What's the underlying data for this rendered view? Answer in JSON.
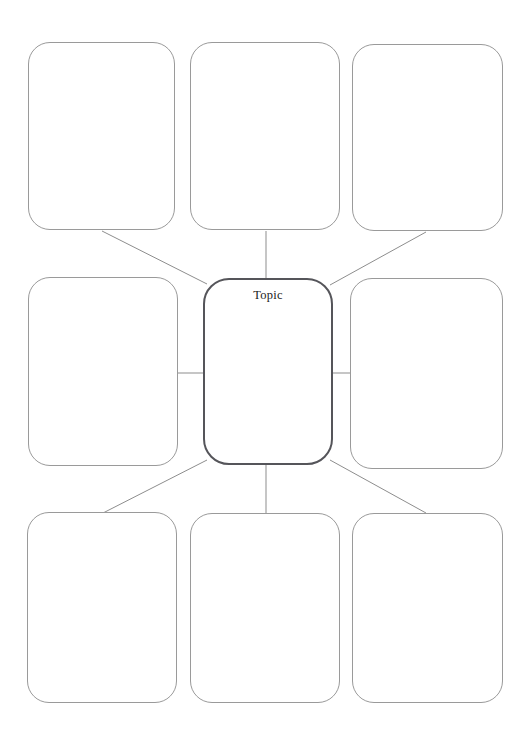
{
  "document": {
    "type": "graphic-organizer",
    "title": "Topic web graphic organizer",
    "page_background": "#ffffff"
  },
  "colors": {
    "page_background": "#ffffff",
    "outer_node_border": "#9a9a9a",
    "center_node_border": "#55555a",
    "connector_line": "#8d8d8d",
    "label_text": "#1d1d1d"
  },
  "center_node": {
    "label": "Topic",
    "x": 203,
    "y": 278,
    "width": 130,
    "height": 187
  },
  "nodes": [
    {
      "id": "node-top-left",
      "label": "",
      "x": 28,
      "y": 42,
      "width": 147,
      "height": 188
    },
    {
      "id": "node-top-center",
      "label": "",
      "x": 190,
      "y": 42,
      "width": 150,
      "height": 188
    },
    {
      "id": "node-top-right",
      "label": "",
      "x": 352,
      "y": 44,
      "width": 151,
      "height": 187
    },
    {
      "id": "node-middle-left",
      "label": "",
      "x": 28,
      "y": 277,
      "width": 150,
      "height": 189
    },
    {
      "id": "node-middle-right",
      "label": "",
      "x": 350,
      "y": 278,
      "width": 153,
      "height": 191
    },
    {
      "id": "node-bottom-left",
      "label": "",
      "x": 27,
      "y": 512,
      "width": 150,
      "height": 191
    },
    {
      "id": "node-bottom-center",
      "label": "",
      "x": 190,
      "y": 513,
      "width": 150,
      "height": 190
    },
    {
      "id": "node-bottom-right",
      "label": "",
      "x": 352,
      "y": 513,
      "width": 151,
      "height": 190
    }
  ],
  "connectors": [
    {
      "id": "connector-top-left",
      "from": "node-top-left",
      "to": "center_node",
      "x1": 102,
      "y1": 231,
      "x2": 207,
      "y2": 284
    },
    {
      "id": "connector-top-center",
      "from": "node-top-center",
      "to": "center_node",
      "x1": 266,
      "y1": 231,
      "x2": 266,
      "y2": 278
    },
    {
      "id": "connector-top-right",
      "from": "node-top-right",
      "to": "center_node",
      "x1": 426,
      "y1": 232,
      "x2": 330,
      "y2": 285
    },
    {
      "id": "connector-middle-left",
      "from": "node-middle-left",
      "to": "center_node",
      "x1": 178,
      "y1": 373,
      "x2": 203,
      "y2": 373
    },
    {
      "id": "connector-middle-right",
      "from": "node-middle-right",
      "to": "center_node",
      "x1": 333,
      "y1": 373,
      "x2": 350,
      "y2": 373
    },
    {
      "id": "connector-bottom-left",
      "from": "center_node",
      "to": "node-bottom-left",
      "x1": 207,
      "y1": 460,
      "x2": 103,
      "y2": 513
    },
    {
      "id": "connector-bottom-center",
      "from": "center_node",
      "to": "node-bottom-center",
      "x1": 266,
      "y1": 465,
      "x2": 266,
      "y2": 513
    },
    {
      "id": "connector-bottom-right",
      "from": "center_node",
      "to": "node-bottom-right",
      "x1": 330,
      "y1": 460,
      "x2": 426,
      "y2": 513
    }
  ]
}
